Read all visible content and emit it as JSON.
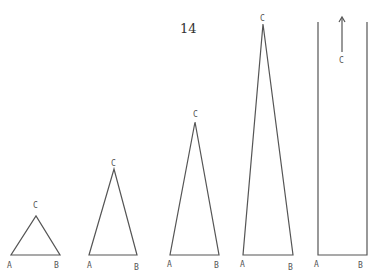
{
  "page_number": "14",
  "labels": {
    "a": "A",
    "b": "B",
    "c": "C"
  },
  "figures": [
    {
      "name": "triangle-1",
      "A": [
        11,
        255
      ],
      "B": [
        60,
        255
      ],
      "C": [
        36,
        216
      ]
    },
    {
      "name": "triangle-2",
      "A": [
        89,
        255
      ],
      "B": [
        137,
        255
      ],
      "C": [
        114,
        169
      ]
    },
    {
      "name": "triangle-3",
      "A": [
        170,
        255
      ],
      "B": [
        219,
        255
      ],
      "C": [
        195,
        122
      ]
    },
    {
      "name": "triangle-4",
      "A": [
        243,
        255
      ],
      "B": [
        293,
        255
      ],
      "C": [
        263,
        24
      ]
    },
    {
      "name": "parallel-limit",
      "A": [
        318,
        255
      ],
      "B": [
        367,
        255
      ],
      "arrow_x": 342
    }
  ]
}
